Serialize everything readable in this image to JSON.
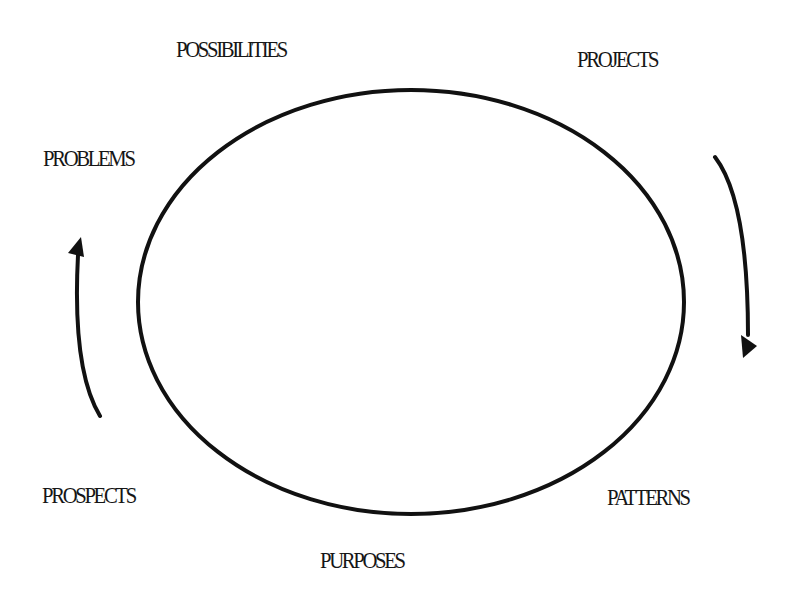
{
  "diagram": {
    "type": "cycle",
    "center_shape": "ellipse",
    "flow_direction": "clockwise",
    "stroke_color": "#111111",
    "background_color": "#ffffff",
    "labels": [
      {
        "id": "possibilities",
        "text": "POSSIBILITIES",
        "position": "top-left"
      },
      {
        "id": "projects",
        "text": "PROJECTS",
        "position": "top-right"
      },
      {
        "id": "patterns",
        "text": "PATTERNS",
        "position": "bottom-right"
      },
      {
        "id": "purposes",
        "text": "PURPOSES",
        "position": "bottom"
      },
      {
        "id": "prospects",
        "text": "PROSPECTS",
        "position": "bottom-left"
      },
      {
        "id": "problems",
        "text": "PROBLEMS",
        "position": "left"
      }
    ],
    "arrows": [
      {
        "id": "right-arrow",
        "side": "right",
        "direction": "down"
      },
      {
        "id": "left-arrow",
        "side": "left",
        "direction": "up"
      }
    ]
  }
}
